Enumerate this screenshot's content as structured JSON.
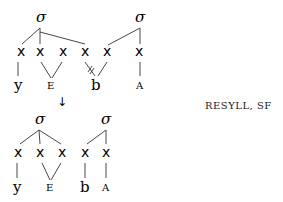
{
  "diagram": {
    "rule_label": "RESYLL, SF",
    "top": {
      "sigmas": [
        "σ",
        "σ"
      ],
      "skeleton": [
        "x",
        "x",
        "x",
        "x",
        "x",
        "x"
      ],
      "segments": [
        "y",
        "E",
        "b",
        "A"
      ],
      "delinked": "x4 -/- b"
    },
    "arrow": "↓",
    "bottom": {
      "sigmas": [
        "σ",
        "σ"
      ],
      "skeleton": [
        "x",
        "x",
        "x",
        "x",
        "x"
      ],
      "segments": [
        "y",
        "E",
        "b",
        "A"
      ]
    }
  }
}
